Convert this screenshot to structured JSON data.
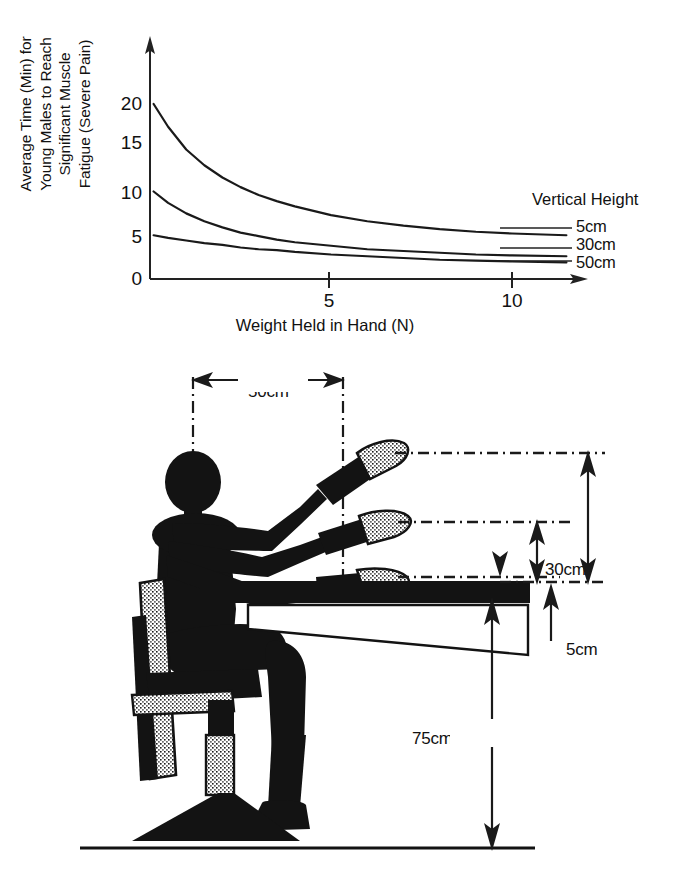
{
  "figure": {
    "kind": "ergonomics-figure",
    "panels": [
      "fatigue-chart",
      "seated-reach-diagram"
    ]
  },
  "chart_data": {
    "type": "line",
    "title": "",
    "xlabel": "Weight Held in Hand (N)",
    "ylabel": "Average Time (Min) for Young Males to Reach Significant Muscle Fatigue (Severe Pain)",
    "ylabel_lines": [
      "Average Time (Min) for",
      "Young Males to Reach",
      "Significant Muscle",
      "Fatigue (Severe Pain)"
    ],
    "xlim": [
      0,
      11.6
    ],
    "ylim": [
      0,
      22
    ],
    "xticks": [
      5,
      10
    ],
    "xticklabels": [
      "5",
      "10"
    ],
    "yticks": [
      0,
      5,
      10,
      15,
      20
    ],
    "yticklabels": [
      "0",
      "5",
      "10",
      "15",
      "20"
    ],
    "grid": false,
    "legend_title": "Vertical Height",
    "legend_position": "right-of-curve-ends",
    "series": [
      {
        "name": "5cm",
        "label": "5cm",
        "color": "#1a1a1a",
        "asymptote": 4.9,
        "start_value": 20.0,
        "x": [
          0.1,
          0.5,
          1,
          1.5,
          2,
          2.5,
          3,
          3.5,
          4,
          5,
          6,
          7,
          8,
          9,
          10,
          11.5
        ],
        "values": [
          20.0,
          17.4,
          14.8,
          13.0,
          11.6,
          10.5,
          9.6,
          8.9,
          8.3,
          7.3,
          6.6,
          6.1,
          5.7,
          5.4,
          5.2,
          5.0
        ]
      },
      {
        "name": "30cm",
        "label": "30cm",
        "color": "#1a1a1a",
        "asymptote": 2.5,
        "start_value": 10.0,
        "x": [
          0.1,
          0.5,
          1,
          1.5,
          2,
          2.5,
          3,
          3.5,
          4,
          5,
          6,
          7,
          8,
          9,
          10,
          11.5
        ],
        "values": [
          10.0,
          8.7,
          7.5,
          6.6,
          5.9,
          5.3,
          4.9,
          4.5,
          4.2,
          3.8,
          3.4,
          3.2,
          3.0,
          2.8,
          2.7,
          2.6
        ]
      },
      {
        "name": "50cm",
        "label": "50cm",
        "color": "#1a1a1a",
        "asymptote": 1.5,
        "start_value": 5.0,
        "x": [
          0.1,
          0.5,
          1,
          1.5,
          2,
          2.5,
          3,
          3.5,
          4,
          5,
          6,
          7,
          8,
          9,
          10,
          11.5
        ],
        "values": [
          5.0,
          4.7,
          4.4,
          4.1,
          3.9,
          3.6,
          3.4,
          3.3,
          3.1,
          2.8,
          2.6,
          2.4,
          2.2,
          2.1,
          2.0,
          1.9
        ]
      }
    ]
  },
  "diagram": {
    "name": "seated-workstation-reach-diagram",
    "dimensions": [
      {
        "id": "reach-horizontal",
        "label": "50cm",
        "orientation": "horizontal",
        "description": "horizontal reach distance from body centerline to hand"
      },
      {
        "id": "height-50",
        "label": "50cm",
        "orientation": "vertical",
        "description": "upper hand height above desk surface"
      },
      {
        "id": "height-30",
        "label": "30cm",
        "orientation": "vertical",
        "description": "middle hand height above desk surface"
      },
      {
        "id": "height-5",
        "label": "5cm",
        "orientation": "vertical",
        "description": "lower hand height above desk surface"
      },
      {
        "id": "desk-height",
        "label": "75cm",
        "orientation": "vertical",
        "description": "desk surface height above floor"
      }
    ],
    "elements": [
      {
        "id": "seated-person",
        "description": "silhouette of seated person with three arm positions"
      },
      {
        "id": "office-chair",
        "description": "office chair with backrest, seat, gas cylinder and star base"
      },
      {
        "id": "desk",
        "description": "desk top with wedge underside"
      },
      {
        "id": "floor-line",
        "description": "ground reference line"
      }
    ]
  }
}
